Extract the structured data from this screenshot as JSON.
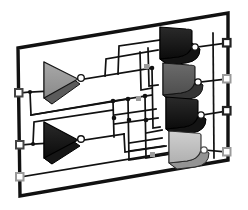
{
  "scene": {
    "title": "3D Logic Circuit Board",
    "type": "isometric-schematic",
    "width": 248,
    "height": 210,
    "background_color": "#ffffff"
  },
  "board": {
    "name": "circuit-board-panel",
    "shape": "skewed-parallelogram",
    "corners": [
      [
        18,
        48
      ],
      [
        228,
        13
      ],
      [
        228,
        160
      ],
      [
        20,
        196
      ]
    ],
    "border_color": "#111111",
    "border_width": 3.2,
    "fill_color": "#ffffff"
  },
  "palette": {
    "wire": "#111111",
    "wire_width": 1.7,
    "junction": "#111111",
    "pad_dark": "#4a4a4a",
    "pad_light": "#9a9a9a",
    "gate_black": "#0b0b0b",
    "gate_dark_gray": "#4e4e4e",
    "gate_mid_gray": "#8f8f8f",
    "gate_light_gray": "#b4b4b4",
    "gate_edge": "#151515",
    "bubble_fill": "#ffffff",
    "bubble_stroke": "#111111"
  },
  "terminals": {
    "left_label": "input-pads",
    "right_label": "output-pads",
    "left": [
      {
        "id": "in-1",
        "x": 19,
        "y": 93,
        "style": "dark"
      },
      {
        "id": "in-2",
        "x": 20,
        "y": 145,
        "style": "dark"
      },
      {
        "id": "in-3",
        "x": 20,
        "y": 177,
        "style": "light"
      }
    ],
    "right": [
      {
        "id": "out-1",
        "x": 227,
        "y": 43,
        "style": "dark"
      },
      {
        "id": "out-2",
        "x": 227,
        "y": 79,
        "style": "light"
      },
      {
        "id": "out-3",
        "x": 227,
        "y": 111,
        "style": "dark"
      },
      {
        "id": "out-4",
        "x": 227,
        "y": 152,
        "style": "light"
      }
    ]
  },
  "gates": {
    "inverters": [
      {
        "id": "inv-1",
        "label": "NOT",
        "x": 44,
        "y": 78,
        "shade": "mid-gray",
        "out_x": 77,
        "out_y": 79
      },
      {
        "id": "inv-2",
        "label": "NOT",
        "x": 44,
        "y": 140,
        "shade": "black",
        "out_x": 77,
        "out_y": 140
      }
    ],
    "and_gates": [
      {
        "id": "and-1",
        "label": "NAND",
        "x": 167,
        "y": 43,
        "shade": "black"
      },
      {
        "id": "and-2",
        "label": "NAND",
        "x": 170,
        "y": 79,
        "shade": "dark-gray"
      },
      {
        "id": "and-3",
        "label": "NAND",
        "x": 172,
        "y": 112,
        "shade": "black"
      },
      {
        "id": "and-4",
        "label": "NAND",
        "x": 175,
        "y": 148,
        "shade": "light-gray"
      }
    ]
  },
  "wiring": {
    "junction_count": 9,
    "routing_style": "orthogonal",
    "notes": "inverter outputs fan out to the four right-hand gate input stacks"
  }
}
